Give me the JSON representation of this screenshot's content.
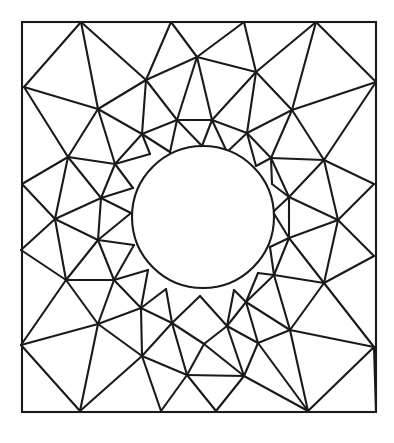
{
  "diagram": {
    "title": "",
    "type": "finite-element triangular mesh of a square plate with a circular hole",
    "colors": {
      "line": "#1a1a1a",
      "background": "#ffffff"
    },
    "outer_boundary": {
      "x1": 22,
      "y1": 22,
      "x2": 376,
      "y2": 412
    },
    "hole": {
      "cx": 203,
      "cy": 217,
      "r": 71
    },
    "nodes": {
      "T0": [
        22,
        22
      ],
      "T1": [
        81,
        22
      ],
      "T2": [
        171,
        22
      ],
      "T3": [
        244,
        22
      ],
      "T4": [
        316,
        22
      ],
      "T5": [
        376,
        22
      ],
      "R1": [
        376,
        82
      ],
      "R2": [
        374,
        184
      ],
      "R3": [
        374,
        256
      ],
      "R4": [
        374,
        347
      ],
      "R5": [
        376,
        412
      ],
      "B1": [
        80,
        411
      ],
      "B2": [
        161,
        411
      ],
      "B3": [
        216,
        411
      ],
      "B4": [
        308,
        411
      ],
      "B0": [
        22,
        412
      ],
      "L1": [
        24,
        87
      ],
      "L2": [
        22,
        184
      ],
      "L3": [
        21,
        250
      ],
      "L4": [
        21,
        345
      ],
      "M1": [
        98,
        109
      ],
      "M2": [
        146,
        80
      ],
      "M3": [
        197,
        57
      ],
      "M4": [
        256,
        72
      ],
      "M5": [
        292,
        110
      ],
      "M6": [
        68,
        157
      ],
      "M7": [
        324,
        160
      ],
      "M8": [
        55,
        219
      ],
      "M9": [
        338,
        220
      ],
      "M10": [
        66,
        280
      ],
      "M11": [
        324,
        283
      ],
      "M12": [
        98,
        324
      ],
      "M13": [
        290,
        330
      ],
      "M14": [
        142,
        356
      ],
      "M15": [
        187,
        375
      ],
      "M16": [
        244,
        376
      ],
      "M17": [
        258,
        343
      ],
      "I1": [
        142,
        134
      ],
      "I2": [
        177,
        120
      ],
      "I3": [
        212,
        120
      ],
      "I4": [
        247,
        133
      ],
      "I5": [
        115,
        164
      ],
      "I6": [
        271,
        158
      ],
      "I7": [
        101,
        198
      ],
      "I8": [
        289,
        197
      ],
      "I9": [
        98,
        240
      ],
      "I10": [
        289,
        238
      ],
      "I11": [
        114,
        280
      ],
      "I12": [
        274,
        275
      ],
      "I13": [
        141,
        308
      ],
      "I14": [
        246,
        302
      ],
      "I15": [
        172,
        323
      ],
      "I16": [
        227,
        326
      ],
      "I17": [
        204,
        344
      ],
      "H1": [
        150,
        154
      ],
      "H2": [
        170,
        152
      ],
      "H3": [
        202,
        146
      ],
      "H4": [
        227,
        152
      ],
      "H5": [
        256,
        166
      ],
      "H6": [
        133,
        188
      ],
      "H7": [
        272,
        184
      ],
      "H8": [
        131,
        213
      ],
      "H9": [
        273,
        212
      ],
      "H10": [
        134,
        245
      ],
      "H11": [
        270,
        247
      ],
      "H12": [
        148,
        270
      ],
      "H13": [
        258,
        273
      ],
      "H14": [
        166,
        289
      ],
      "H15": [
        234,
        290
      ],
      "H16": [
        200,
        296
      ]
    },
    "edges": [
      [
        "T1",
        "L1"
      ],
      [
        "T1",
        "M1"
      ],
      [
        "T1",
        "M2"
      ],
      [
        "L1",
        "M1"
      ],
      [
        "L1",
        "M6"
      ],
      [
        "T2",
        "M2"
      ],
      [
        "T2",
        "M3"
      ],
      [
        "M2",
        "M3"
      ],
      [
        "M2",
        "M1"
      ],
      [
        "M2",
        "I1"
      ],
      [
        "M2",
        "I2"
      ],
      [
        "M3",
        "I2"
      ],
      [
        "M3",
        "I3"
      ],
      [
        "M3",
        "M4"
      ],
      [
        "T3",
        "M3"
      ],
      [
        "T3",
        "M4"
      ],
      [
        "T4",
        "M4"
      ],
      [
        "T4",
        "M5"
      ],
      [
        "T4",
        "R1"
      ],
      [
        "R1",
        "M5"
      ],
      [
        "R1",
        "M7"
      ],
      [
        "M4",
        "I3"
      ],
      [
        "M4",
        "I4"
      ],
      [
        "M4",
        "M5"
      ],
      [
        "M5",
        "I4"
      ],
      [
        "M5",
        "I6"
      ],
      [
        "M5",
        "M7"
      ],
      [
        "M1",
        "I1"
      ],
      [
        "M1",
        "M6"
      ],
      [
        "M1",
        "I5"
      ],
      [
        "M6",
        "I5"
      ],
      [
        "M6",
        "L2"
      ],
      [
        "M6",
        "M8"
      ],
      [
        "M6",
        "I7"
      ],
      [
        "I1",
        "I2"
      ],
      [
        "I2",
        "I3"
      ],
      [
        "I3",
        "I4"
      ],
      [
        "I1",
        "I5"
      ],
      [
        "I4",
        "I6"
      ],
      [
        "I1",
        "H1"
      ],
      [
        "I1",
        "H2"
      ],
      [
        "I2",
        "H2"
      ],
      [
        "I2",
        "H3"
      ],
      [
        "I3",
        "H3"
      ],
      [
        "I3",
        "H4"
      ],
      [
        "I4",
        "H4"
      ],
      [
        "I4",
        "H5"
      ],
      [
        "I5",
        "H1"
      ],
      [
        "I5",
        "H6"
      ],
      [
        "I5",
        "I7"
      ],
      [
        "I6",
        "H5"
      ],
      [
        "I6",
        "H7"
      ],
      [
        "I6",
        "I8"
      ],
      [
        "I6",
        "M7"
      ],
      [
        "M7",
        "R2"
      ],
      [
        "M7",
        "I8"
      ],
      [
        "M7",
        "M9"
      ],
      [
        "R2",
        "M9"
      ],
      [
        "M9",
        "R3"
      ],
      [
        "M9",
        "I8"
      ],
      [
        "M9",
        "I10"
      ],
      [
        "M9",
        "M11"
      ],
      [
        "L2",
        "M8"
      ],
      [
        "M8",
        "I7"
      ],
      [
        "M8",
        "I9"
      ],
      [
        "M8",
        "L3"
      ],
      [
        "M8",
        "M10"
      ],
      [
        "I7",
        "H6"
      ],
      [
        "I7",
        "H8"
      ],
      [
        "I7",
        "I9"
      ],
      [
        "I8",
        "H7"
      ],
      [
        "I8",
        "H9"
      ],
      [
        "I8",
        "I10"
      ],
      [
        "I9",
        "H8"
      ],
      [
        "I9",
        "H10"
      ],
      [
        "I9",
        "M10"
      ],
      [
        "I9",
        "I11"
      ],
      [
        "I10",
        "H9"
      ],
      [
        "I10",
        "H11"
      ],
      [
        "I10",
        "M11"
      ],
      [
        "I10",
        "I12"
      ],
      [
        "L3",
        "M10"
      ],
      [
        "M10",
        "L4"
      ],
      [
        "M10",
        "M12"
      ],
      [
        "M10",
        "I11"
      ],
      [
        "R3",
        "M11"
      ],
      [
        "M11",
        "R4"
      ],
      [
        "M11",
        "I12"
      ],
      [
        "M11",
        "M13"
      ],
      [
        "I11",
        "H10"
      ],
      [
        "I11",
        "H12"
      ],
      [
        "I11",
        "M12"
      ],
      [
        "I11",
        "I13"
      ],
      [
        "I12",
        "H11"
      ],
      [
        "I12",
        "H13"
      ],
      [
        "I12",
        "M13"
      ],
      [
        "I12",
        "I14"
      ],
      [
        "L4",
        "M12"
      ],
      [
        "L4",
        "B1"
      ],
      [
        "M12",
        "B1"
      ],
      [
        "M12",
        "M14"
      ],
      [
        "M12",
        "I13"
      ],
      [
        "R4",
        "M13"
      ],
      [
        "R4",
        "B4"
      ],
      [
        "M13",
        "B4"
      ],
      [
        "M13",
        "M17"
      ],
      [
        "M13",
        "I14"
      ],
      [
        "I13",
        "H12"
      ],
      [
        "I13",
        "H14"
      ],
      [
        "I13",
        "M14"
      ],
      [
        "I13",
        "I15"
      ],
      [
        "I14",
        "H13"
      ],
      [
        "I14",
        "H15"
      ],
      [
        "I14",
        "M17"
      ],
      [
        "I14",
        "I16"
      ],
      [
        "I15",
        "H14"
      ],
      [
        "I15",
        "H16"
      ],
      [
        "I15",
        "I17"
      ],
      [
        "I15",
        "M14"
      ],
      [
        "I15",
        "M15"
      ],
      [
        "I16",
        "H15"
      ],
      [
        "I16",
        "H16"
      ],
      [
        "I16",
        "I17"
      ],
      [
        "I16",
        "M17"
      ],
      [
        "I16",
        "M16"
      ],
      [
        "I17",
        "M15"
      ],
      [
        "I17",
        "M16"
      ],
      [
        "M15",
        "M16"
      ],
      [
        "B1",
        "M14"
      ],
      [
        "M14",
        "B2"
      ],
      [
        "M14",
        "M15"
      ],
      [
        "M15",
        "B2"
      ],
      [
        "M15",
        "B3"
      ],
      [
        "M16",
        "B3"
      ],
      [
        "M16",
        "M17"
      ],
      [
        "M17",
        "B4"
      ],
      [
        "M16",
        "B4"
      ],
      [
        "R4",
        "R5"
      ]
    ]
  }
}
